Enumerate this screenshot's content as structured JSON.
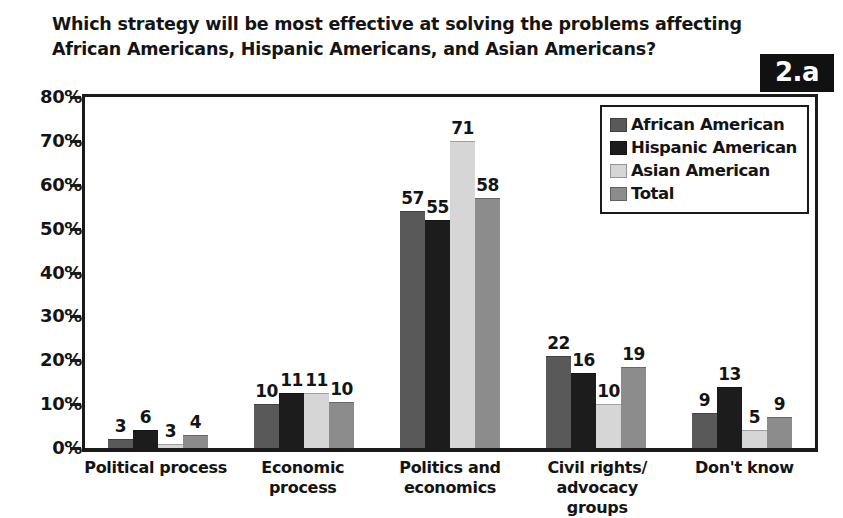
{
  "badge": {
    "label": "2.a"
  },
  "title": {
    "line1": "Which strategy will be most effective at solving the problems affecting",
    "line2": "African Americans, Hispanic Americans, and Asian Americans?"
  },
  "legend": {
    "position": "top-right-inside-plot",
    "entries": [
      {
        "label": "African American",
        "color": "#595959",
        "swatch_icon": "legend-swatch-square"
      },
      {
        "label": "Hispanic American",
        "color": "#1c1c1c",
        "swatch_icon": "legend-swatch-square"
      },
      {
        "label": "Asian American",
        "color": "#d6d6d6",
        "swatch_icon": "legend-swatch-square"
      },
      {
        "label": "Total",
        "color": "#8c8c8c",
        "swatch_icon": "legend-swatch-square"
      }
    ]
  },
  "yaxis": {
    "ticks": [
      "0%",
      "10%",
      "20%",
      "30%",
      "40%",
      "50%",
      "60%",
      "70%",
      "80%"
    ]
  },
  "chart_data": {
    "type": "bar",
    "title": "Which strategy will be most effective at solving the problems affecting African Americans, Hispanic Americans, and Asian Americans?",
    "xlabel": "",
    "ylabel": "",
    "ylim": [
      0,
      80
    ],
    "ytick_step": 10,
    "ytick_suffix": "%",
    "grid": false,
    "legend_position": "upper right",
    "categories": [
      "Political process",
      "Economic process",
      "Politics and economics",
      "Civil rights/ advocacy groups",
      "Don't know"
    ],
    "category_lines": [
      [
        "Political process"
      ],
      [
        "Economic process"
      ],
      [
        "Politics and",
        "economics"
      ],
      [
        "Civil rights/",
        "advocacy groups"
      ],
      [
        "Don't know"
      ]
    ],
    "series": [
      {
        "name": "African American",
        "color": "#595959",
        "values": [
          3,
          10,
          57,
          22,
          9
        ]
      },
      {
        "name": "Hispanic American",
        "color": "#1c1c1c",
        "values": [
          6,
          11,
          55,
          16,
          13
        ]
      },
      {
        "name": "Asian American",
        "color": "#d6d6d6",
        "values": [
          3,
          11,
          71,
          10,
          5
        ]
      },
      {
        "name": "Total",
        "color": "#8c8c8c",
        "values": [
          4,
          10,
          58,
          19,
          9
        ]
      }
    ],
    "bar_heights_percent": [
      [
        2,
        10,
        54,
        21,
        8
      ],
      [
        4,
        12.5,
        52,
        17,
        14
      ],
      [
        1,
        12.5,
        70,
        10,
        4
      ],
      [
        3,
        10.5,
        57,
        18.5,
        7
      ]
    ],
    "data_labels_shown": true
  }
}
